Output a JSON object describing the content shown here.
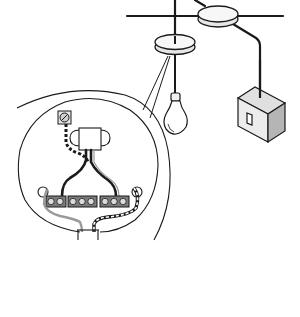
{
  "diagram": {
    "title": "",
    "colors": {
      "background": "#ffffff",
      "line": "#1a1a1a",
      "fill_light": "#f2f2f2",
      "fill_mid": "#d9d9d9",
      "fill_dark": "#7a7a7a",
      "grey_wire": "#9a9a9a"
    },
    "components": [
      {
        "id": "junction-box",
        "label": ""
      },
      {
        "id": "ceiling-rose",
        "label": ""
      },
      {
        "id": "pendant-bulb",
        "label": ""
      },
      {
        "id": "wall-switch",
        "label": ""
      },
      {
        "id": "magnified-rose",
        "label": ""
      },
      {
        "id": "terminal-block",
        "label": "",
        "terminals": 8
      },
      {
        "id": "earth-terminal",
        "label": ""
      },
      {
        "id": "bulb-holder",
        "label": ""
      }
    ]
  }
}
